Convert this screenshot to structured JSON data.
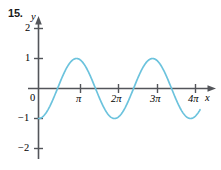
{
  "exercise": {
    "number": "15."
  },
  "chart_data": {
    "type": "line",
    "title": "",
    "subtitle": "",
    "xlabel": "x",
    "ylabel": "y",
    "function": "y = -cos x",
    "grid": false,
    "legend": null,
    "xlim": [
      -0.35,
      13.6
    ],
    "ylim": [
      -2.35,
      2.35
    ],
    "xtick_labels": [
      "0",
      "π",
      "2π",
      "3π",
      "4π"
    ],
    "xtick_values": [
      0,
      3.14159,
      6.28319,
      9.42478,
      12.56637
    ],
    "ytick_labels": [
      "2",
      "1",
      "−1",
      "−2"
    ],
    "ytick_values": [
      2,
      1,
      -1,
      -2
    ],
    "series": [
      {
        "name": "y = -cos x",
        "amplitude": 1.0,
        "period": 6.28319,
        "x_start": 0.0,
        "x_end": 13.35,
        "x": [
          0.0,
          0.4,
          0.8,
          1.2,
          1.6,
          2.0,
          2.4,
          2.8,
          3.2,
          3.6,
          4.0,
          4.4,
          4.8,
          5.2,
          5.6,
          6.0,
          6.4,
          6.8,
          7.2,
          7.6,
          8.0,
          8.4,
          8.8,
          9.2,
          9.6,
          10.0,
          10.4,
          10.8,
          11.2,
          11.6,
          12.0,
          12.4,
          12.8,
          13.35
        ],
        "y": [
          -1.0,
          -0.921,
          -0.697,
          -0.362,
          0.029,
          0.416,
          0.737,
          0.942,
          0.998,
          0.896,
          0.654,
          0.307,
          -0.087,
          -0.469,
          -0.776,
          -0.96,
          -0.993,
          -0.869,
          -0.608,
          -0.251,
          0.145,
          0.519,
          0.811,
          0.973,
          0.985,
          0.839,
          0.561,
          0.194,
          -0.213,
          -0.568,
          -0.844,
          -0.986,
          -0.977,
          -0.776
        ]
      }
    ],
    "axis_arrows": [
      "x-positive",
      "y-positive"
    ],
    "colors": {
      "curve": "#6cc3dd",
      "axis": "#53555a",
      "text": "#1a1a1a",
      "background": "#ffffff"
    }
  },
  "labels": {
    "y_axis": "y",
    "x_axis": "x",
    "origin": "0",
    "y_two": "2",
    "y_one": "1",
    "y_neg_one": "−1",
    "y_neg_two": "−2",
    "x_pi": "π",
    "x_2pi": "2π",
    "x_3pi": "3π",
    "x_4pi": "4π"
  }
}
